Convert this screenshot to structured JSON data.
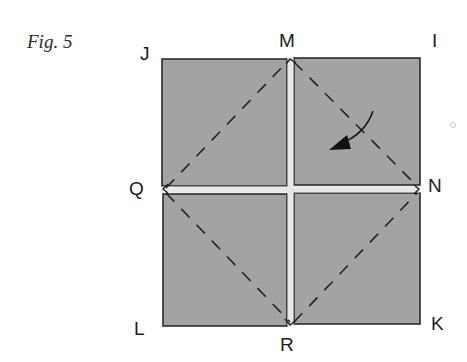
{
  "figure": {
    "caption": "Fig. 5",
    "points": {
      "J": "J",
      "M": "M",
      "I": "I",
      "Q": "Q",
      "N": "N",
      "L": "L",
      "R": "R",
      "K": "K"
    },
    "colors": {
      "paper_fill": "#a3a3a3",
      "outline": "#2b2b2b",
      "gap": "#e8e8e8",
      "dashes": "#222222",
      "arrow": "#111111"
    }
  }
}
